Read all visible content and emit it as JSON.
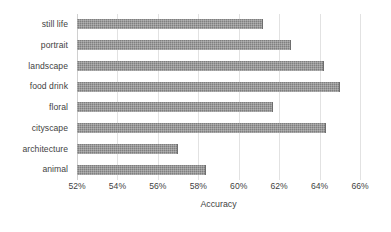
{
  "chart_data": {
    "type": "bar",
    "orientation": "horizontal",
    "title": "",
    "xlabel": "Accuracy",
    "ylabel": "",
    "xlim": [
      52,
      66
    ],
    "xtick_step": 2,
    "xtick_labels": [
      "52%",
      "54%",
      "56%",
      "58%",
      "60%",
      "62%",
      "64%",
      "66%"
    ],
    "xtick_values": [
      52,
      54,
      56,
      58,
      60,
      62,
      64,
      66
    ],
    "grid": "vertical",
    "legend": "none",
    "value_suffix": "%",
    "bar_color": "#7f7f7f",
    "gridline_color": "#e2e2e2",
    "background_color": "#ffffff",
    "categories": [
      "still life",
      "portrait",
      "landscape",
      "food drink",
      "floral",
      "cityscape",
      "architecture",
      "animal"
    ],
    "values": [
      61.2,
      62.6,
      64.2,
      65.0,
      61.7,
      64.3,
      57.0,
      58.4
    ],
    "bars": [
      {
        "category": "still life",
        "value": 61.2
      },
      {
        "category": "portrait",
        "value": 62.6
      },
      {
        "category": "landscape",
        "value": 64.2
      },
      {
        "category": "food drink",
        "value": 65.0
      },
      {
        "category": "floral",
        "value": 61.7
      },
      {
        "category": "cityscape",
        "value": 64.3
      },
      {
        "category": "architecture",
        "value": 57.0
      },
      {
        "category": "animal",
        "value": 58.4
      }
    ]
  }
}
